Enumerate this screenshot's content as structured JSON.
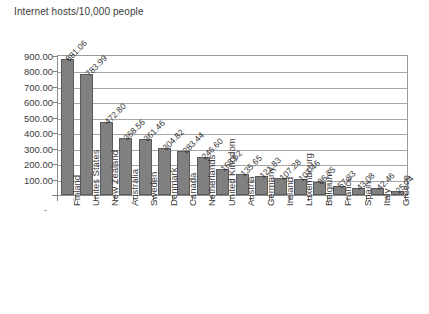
{
  "chart_data": {
    "type": "bar",
    "title": "Internet hosts/10,000 people",
    "xlabel": "",
    "ylabel": "",
    "ylim": [
      0,
      900
    ],
    "ytick_step": 100,
    "ytick_labels": [
      "900.00",
      "800.00",
      "700.00",
      "600.00",
      "500.00",
      "400.00",
      "300.00",
      "200.00",
      "100.00"
    ],
    "ytick_values": [
      900,
      800,
      700,
      600,
      500,
      400,
      300,
      200,
      100
    ],
    "grid": true,
    "legend": "none",
    "bar_color": "#808080",
    "bar_edge_color": "#5a5a5a",
    "grid_color": "#a6a6a6",
    "categories": [
      "Finland",
      "Unites States",
      "New Zealand",
      "Australia",
      "Sweden",
      "Denmark",
      "Canada",
      "Netherlands",
      "United Kingdom",
      "Austria",
      "Germany",
      "Ireland",
      "Luxembourg",
      "Belgium",
      "France",
      "Spain",
      "Italy",
      "Greece"
    ],
    "values": [
      881.06,
      783.99,
      472.8,
      368.56,
      361.46,
      304.82,
      283.44,
      246.6,
      168.52,
      135.65,
      121.83,
      107.28,
      103.46,
      86.75,
      57.33,
      43.08,
      42.46,
      25.74
    ],
    "value_labels": [
      "881.06",
      "783.99",
      "472.80",
      "368.56",
      "361.46",
      "304.82",
      "283.44",
      "246.60",
      "168.52",
      "135.65",
      "121.83",
      "107.28",
      "103.46",
      "86.75",
      "57.33",
      "43.08",
      "42.46",
      "25.74"
    ],
    "zero_tick_label": "-"
  }
}
